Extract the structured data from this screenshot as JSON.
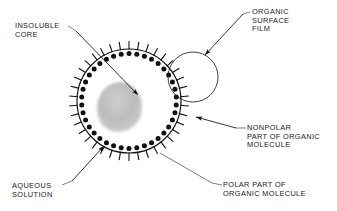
{
  "diagram": {
    "type": "scientific-schematic",
    "background_color": "#ffffff",
    "ink_color": "#111111",
    "core_color": "#b0b0b0",
    "labels": {
      "insoluble_core": "INSOLUBLE\nCORE",
      "organic_surface_film": "ORGANIC\nSURFACE\nFILM",
      "nonpolar_part": "NONPOLAR\nPART OF ORGANIC\nMOLECULE",
      "aqueous_solution": "AQUEOUS\nSOLUTION",
      "polar_part": "POLAR PART OF\nORGANIC MOLECULE"
    },
    "geometry": {
      "main_circle": {
        "cx": 129,
        "cy": 101,
        "r": 52
      },
      "callout_circle": {
        "cx": 193,
        "cy": 77,
        "r": 25
      },
      "core_blob": {
        "cx": 120,
        "cy": 107,
        "rx": 21,
        "ry": 25,
        "rotation": -28
      },
      "molecule_count": 38,
      "head_radius": 2.5,
      "tail_length": 8
    }
  }
}
